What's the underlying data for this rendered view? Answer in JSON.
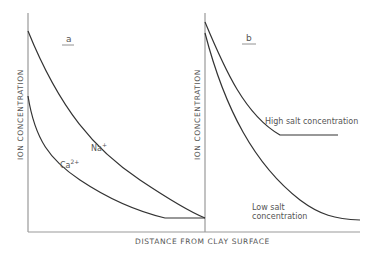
{
  "figure": {
    "panels": [
      {
        "id": "a",
        "label": "a",
        "y_axis_label": "ION CONCENTRATION",
        "curves": [
          {
            "name": "Na+",
            "label_main": "Na",
            "label_sup": "+"
          },
          {
            "name": "Ca2+",
            "label_main": "Ca",
            "label_sup": "2+"
          }
        ]
      },
      {
        "id": "b",
        "label": "b",
        "y_axis_label": "ION CONCENTRATION",
        "curves": [
          {
            "name": "High salt concentration",
            "label": "High salt concentration"
          },
          {
            "name": "Low salt concentration",
            "label_line1": "Low salt",
            "label_line2": "concentration"
          }
        ]
      }
    ],
    "x_axis_label": "DISTANCE FROM CLAY SURFACE"
  },
  "colors": {
    "axis": "#999999",
    "curve": "#333333",
    "text": "#555555"
  }
}
